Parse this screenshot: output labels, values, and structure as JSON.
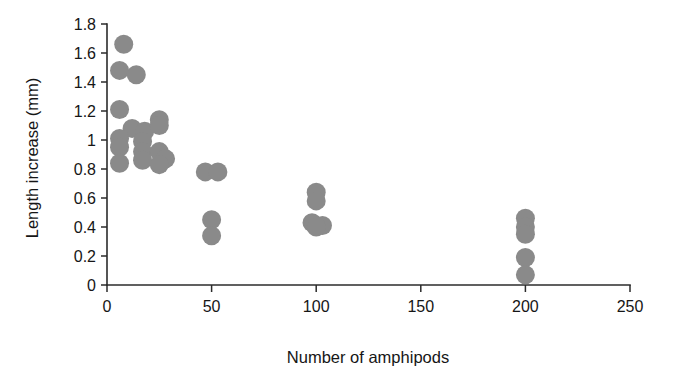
{
  "chart_data": {
    "type": "scatter",
    "title": "",
    "xlabel": "Number of amphipods",
    "ylabel": "Length increase (mm)",
    "xlim": [
      0,
      250
    ],
    "ylim": [
      0,
      1.8
    ],
    "xticks": [
      0,
      50,
      100,
      150,
      200,
      250
    ],
    "xtick_labels": [
      "0",
      "50",
      "100",
      "150",
      "200",
      "250"
    ],
    "yticks": [
      0,
      0.2,
      0.4,
      0.6,
      0.8,
      1.0,
      1.2,
      1.4,
      1.6,
      1.8
    ],
    "ytick_labels": [
      "0",
      "0.2",
      "0.4",
      "0.6",
      "0.8",
      "1",
      "1.2",
      "1.4",
      "1.6",
      "1.8"
    ],
    "grid": false,
    "legend": false,
    "marker": {
      "shape": "circle",
      "color": "#8a8a8a",
      "radius_px": 9.5
    },
    "series": [
      {
        "name": "Length increase vs amphipod density",
        "color": "#8a8a8a",
        "points": [
          {
            "x": 8,
            "y": 1.66
          },
          {
            "x": 6,
            "y": 1.48
          },
          {
            "x": 14,
            "y": 1.45
          },
          {
            "x": 6,
            "y": 1.21
          },
          {
            "x": 12,
            "y": 1.08
          },
          {
            "x": 18,
            "y": 1.06
          },
          {
            "x": 6,
            "y": 1.01
          },
          {
            "x": 17,
            "y": 0.99
          },
          {
            "x": 6,
            "y": 0.95
          },
          {
            "x": 17,
            "y": 0.92
          },
          {
            "x": 6,
            "y": 0.84
          },
          {
            "x": 17,
            "y": 0.86
          },
          {
            "x": 25,
            "y": 1.14
          },
          {
            "x": 25,
            "y": 1.1
          },
          {
            "x": 25,
            "y": 0.92
          },
          {
            "x": 28,
            "y": 0.87
          },
          {
            "x": 25,
            "y": 0.83
          },
          {
            "x": 47,
            "y": 0.78
          },
          {
            "x": 53,
            "y": 0.78
          },
          {
            "x": 50,
            "y": 0.45
          },
          {
            "x": 50,
            "y": 0.34
          },
          {
            "x": 100,
            "y": 0.64
          },
          {
            "x": 100,
            "y": 0.58
          },
          {
            "x": 98,
            "y": 0.43
          },
          {
            "x": 103,
            "y": 0.41
          },
          {
            "x": 100,
            "y": 0.4
          },
          {
            "x": 200,
            "y": 0.46
          },
          {
            "x": 200,
            "y": 0.4
          },
          {
            "x": 200,
            "y": 0.35
          },
          {
            "x": 200,
            "y": 0.19
          },
          {
            "x": 200,
            "y": 0.07
          }
        ]
      }
    ]
  }
}
